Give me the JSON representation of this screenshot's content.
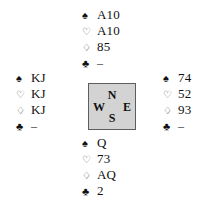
{
  "diagram": {
    "type": "bridge-hand-diagram",
    "suit_symbols": {
      "spade": "♠",
      "heart": "♡",
      "diamond": "♢",
      "club": "♣"
    },
    "void_mark": "–",
    "compass": {
      "north": "N",
      "west": "W",
      "east": "E",
      "south": "S",
      "fill_color": "#d3d3d3",
      "border_color": "#5e5e5e"
    },
    "hands": {
      "north": {
        "label": "North",
        "spades": "A10",
        "hearts": "A10",
        "diamonds": "85",
        "clubs": "–"
      },
      "west": {
        "label": "West",
        "spades": "KJ",
        "hearts": "KJ",
        "diamonds": "KJ",
        "clubs": "–"
      },
      "east": {
        "label": "East",
        "spades": "74",
        "hearts": "52",
        "diamonds": "93",
        "clubs": "–"
      },
      "south": {
        "label": "South",
        "spades": "Q",
        "hearts": "73",
        "diamonds": "AQ",
        "clubs": "2"
      }
    }
  }
}
